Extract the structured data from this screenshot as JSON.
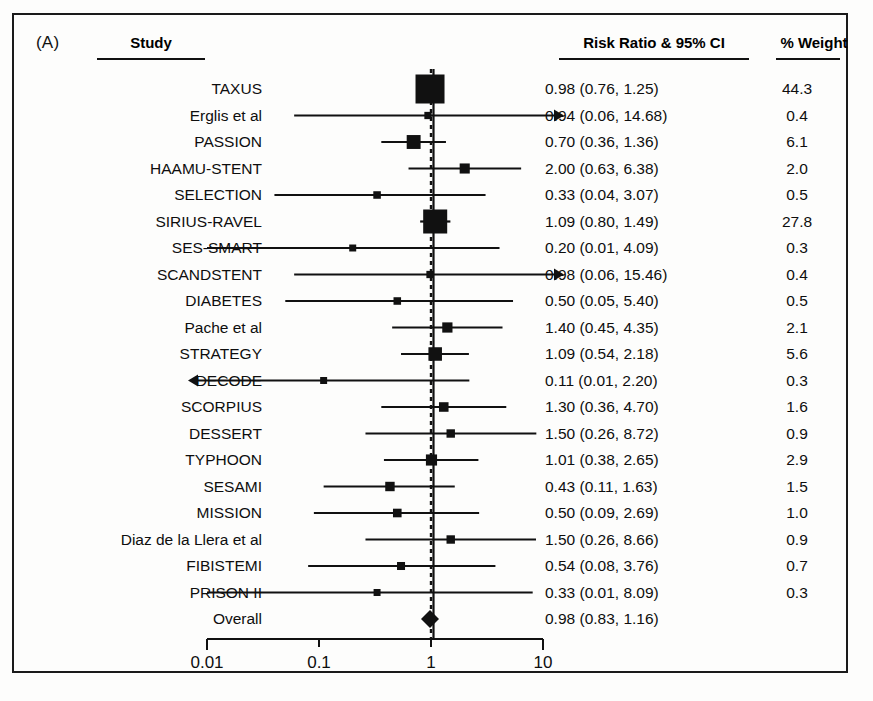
{
  "figure": {
    "panel_letter": "(A)",
    "background_color": "#fdfdfc",
    "ink_color": "#111111"
  },
  "columns": {
    "study": "Study",
    "risk_ratio": "Risk Ratio & 95% CI",
    "weight": "% Weight"
  },
  "axis": {
    "scale": "log10",
    "min": 0.01,
    "max": 10,
    "ticks": [
      {
        "value": 0.01,
        "label": "0.01"
      },
      {
        "value": 0.1,
        "label": "0.1"
      },
      {
        "value": 1,
        "label": "1"
      },
      {
        "value": 10,
        "label": "10"
      }
    ],
    "reference_line": 1
  },
  "chart_data": {
    "type": "forest",
    "title": "Risk Ratio & 95% CI",
    "xlabel": "",
    "ylabel": "",
    "xscale": "log",
    "xlim": [
      0.01,
      10
    ],
    "reference_line": 1,
    "grid": false,
    "legend": "none",
    "effect_measure": "Risk Ratio",
    "ci_level": "95%",
    "columns": [
      "Study",
      "Risk Ratio & 95% CI",
      "% Weight"
    ],
    "rows": [
      {
        "study": "TAXUS",
        "estimate": 0.98,
        "lower": 0.76,
        "upper": 1.25,
        "ci_text": "0.98 (0.76, 1.25)",
        "weight": 44.3,
        "weight_text": "44.3",
        "summary": false,
        "arrow_left": false,
        "arrow_right": false
      },
      {
        "study": "Erglis et al",
        "estimate": 0.94,
        "lower": 0.06,
        "upper": 14.68,
        "ci_text": "0.94 (0.06, 14.68)",
        "weight": 0.4,
        "weight_text": "0.4",
        "summary": false,
        "arrow_left": false,
        "arrow_right": true
      },
      {
        "study": "PASSION",
        "estimate": 0.7,
        "lower": 0.36,
        "upper": 1.36,
        "ci_text": "0.70 (0.36, 1.36)",
        "weight": 6.1,
        "weight_text": "6.1",
        "summary": false,
        "arrow_left": false,
        "arrow_right": false
      },
      {
        "study": "HAAMU-STENT",
        "estimate": 2.0,
        "lower": 0.63,
        "upper": 6.38,
        "ci_text": "2.00 (0.63, 6.38)",
        "weight": 2.0,
        "weight_text": "2.0",
        "summary": false,
        "arrow_left": false,
        "arrow_right": false
      },
      {
        "study": "SELECTION",
        "estimate": 0.33,
        "lower": 0.04,
        "upper": 3.07,
        "ci_text": "0.33 (0.04, 3.07)",
        "weight": 0.5,
        "weight_text": "0.5",
        "summary": false,
        "arrow_left": false,
        "arrow_right": false
      },
      {
        "study": "SIRIUS-RAVEL",
        "estimate": 1.09,
        "lower": 0.8,
        "upper": 1.49,
        "ci_text": "1.09 (0.80, 1.49)",
        "weight": 27.8,
        "weight_text": "27.8",
        "summary": false,
        "arrow_left": false,
        "arrow_right": false
      },
      {
        "study": "SES-SMART",
        "estimate": 0.2,
        "lower": 0.01,
        "upper": 4.09,
        "ci_text": "0.20 (0.01, 4.09)",
        "weight": 0.3,
        "weight_text": "0.3",
        "summary": false,
        "arrow_left": false,
        "arrow_right": false
      },
      {
        "study": "SCANDSTENT",
        "estimate": 0.98,
        "lower": 0.06,
        "upper": 15.46,
        "ci_text": "0.98 (0.06, 15.46)",
        "weight": 0.4,
        "weight_text": "0.4",
        "summary": false,
        "arrow_left": false,
        "arrow_right": true
      },
      {
        "study": "DIABETES",
        "estimate": 0.5,
        "lower": 0.05,
        "upper": 5.4,
        "ci_text": "0.50 (0.05, 5.40)",
        "weight": 0.5,
        "weight_text": "0.5",
        "summary": false,
        "arrow_left": false,
        "arrow_right": false
      },
      {
        "study": "Pache et al",
        "estimate": 1.4,
        "lower": 0.45,
        "upper": 4.35,
        "ci_text": "1.40 (0.45, 4.35)",
        "weight": 2.1,
        "weight_text": "2.1",
        "summary": false,
        "arrow_left": false,
        "arrow_right": false
      },
      {
        "study": "STRATEGY",
        "estimate": 1.09,
        "lower": 0.54,
        "upper": 2.18,
        "ci_text": "1.09 (0.54, 2.18)",
        "weight": 5.6,
        "weight_text": "5.6",
        "summary": false,
        "arrow_left": false,
        "arrow_right": false
      },
      {
        "study": "DECODE",
        "estimate": 0.11,
        "lower": 0.01,
        "upper": 2.2,
        "ci_text": "0.11 (0.01, 2.20)",
        "weight": 0.3,
        "weight_text": "0.3",
        "summary": false,
        "arrow_left": true,
        "arrow_right": false
      },
      {
        "study": "SCORPIUS",
        "estimate": 1.3,
        "lower": 0.36,
        "upper": 4.7,
        "ci_text": "1.30 (0.36, 4.70)",
        "weight": 1.6,
        "weight_text": "1.6",
        "summary": false,
        "arrow_left": false,
        "arrow_right": false
      },
      {
        "study": "DESSERT",
        "estimate": 1.5,
        "lower": 0.26,
        "upper": 8.72,
        "ci_text": "1.50 (0.26, 8.72)",
        "weight": 0.9,
        "weight_text": "0.9",
        "summary": false,
        "arrow_left": false,
        "arrow_right": false
      },
      {
        "study": "TYPHOON",
        "estimate": 1.01,
        "lower": 0.38,
        "upper": 2.65,
        "ci_text": "1.01 (0.38, 2.65)",
        "weight": 2.9,
        "weight_text": "2.9",
        "summary": false,
        "arrow_left": false,
        "arrow_right": false
      },
      {
        "study": "SESAMI",
        "estimate": 0.43,
        "lower": 0.11,
        "upper": 1.63,
        "ci_text": "0.43 (0.11, 1.63)",
        "weight": 1.5,
        "weight_text": "1.5",
        "summary": false,
        "arrow_left": false,
        "arrow_right": false
      },
      {
        "study": "MISSION",
        "estimate": 0.5,
        "lower": 0.09,
        "upper": 2.69,
        "ci_text": "0.50 (0.09, 2.69)",
        "weight": 1.0,
        "weight_text": "1.0",
        "summary": false,
        "arrow_left": false,
        "arrow_right": false
      },
      {
        "study": "Diaz de la Llera et al",
        "estimate": 1.5,
        "lower": 0.26,
        "upper": 8.66,
        "ci_text": "1.50 (0.26, 8.66)",
        "weight": 0.9,
        "weight_text": "0.9",
        "summary": false,
        "arrow_left": false,
        "arrow_right": false
      },
      {
        "study": "FIBISTEMI",
        "estimate": 0.54,
        "lower": 0.08,
        "upper": 3.76,
        "ci_text": "0.54 (0.08, 3.76)",
        "weight": 0.7,
        "weight_text": "0.7",
        "summary": false,
        "arrow_left": false,
        "arrow_right": false
      },
      {
        "study": "PRISON II",
        "estimate": 0.33,
        "lower": 0.01,
        "upper": 8.09,
        "ci_text": "0.33 (0.01, 8.09)",
        "weight": 0.3,
        "weight_text": "0.3",
        "summary": false,
        "arrow_left": false,
        "arrow_right": false
      },
      {
        "study": "Overall",
        "estimate": 0.98,
        "lower": 0.83,
        "upper": 1.16,
        "ci_text": "0.98 (0.83, 1.16)",
        "weight": null,
        "weight_text": "",
        "summary": true,
        "arrow_left": false,
        "arrow_right": false
      }
    ]
  }
}
